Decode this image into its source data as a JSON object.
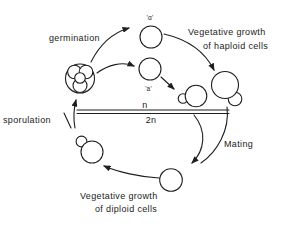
{
  "figure": {
    "background_color": "#ffffff",
    "ink_color": "#1e1e1e",
    "labels": {
      "germination": "germination",
      "sporulation": "sporulation",
      "mating": "Mating",
      "veg_haploid_line1": "Vegetative growth",
      "veg_haploid_line2": "of haploid cells",
      "veg_diploid_line1": "Vegetative growth",
      "veg_diploid_line2": "of diploid cells",
      "ploidy_haploid": "n",
      "ploidy_diploid": "2n",
      "mating_type_alpha": "'α'",
      "mating_type_a": "'a'"
    }
  }
}
